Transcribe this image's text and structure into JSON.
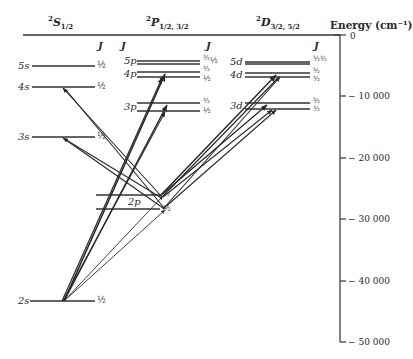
{
  "diagram": {
    "type": "grotrian-energy-level-diagram",
    "columns": [
      {
        "term": "S",
        "multiplicity": "2",
        "subscript": "1/2",
        "j_header": "J"
      },
      {
        "term": "P",
        "multiplicity": "2",
        "subscript": "1/2, 3/2",
        "j_header": "J"
      },
      {
        "term": "D",
        "multiplicity": "2",
        "subscript": "3/2, 5/2",
        "j_header": "J"
      }
    ],
    "axis": {
      "title": "Energy (cm⁻¹)",
      "ticks": [
        "0",
        "− 10 000",
        "− 20 000",
        "− 30 000",
        "− 40 000",
        "− 50 000"
      ],
      "tick_values": [
        0,
        -10000,
        -20000,
        -30000,
        -40000,
        -50000
      ]
    },
    "levels": {
      "s": [
        {
          "label": "5s",
          "j": "½",
          "energy": -5000
        },
        {
          "label": "4s",
          "j": "½",
          "energy": -8500
        },
        {
          "label": "3s",
          "j": "½",
          "energy": -16500
        },
        {
          "label": "2s",
          "j": "½",
          "energy": -43500
        }
      ],
      "p": [
        {
          "label": "5p",
          "j_values": [
            "³⁄₂",
            "½"
          ],
          "energies": [
            -4300,
            -4700
          ]
        },
        {
          "label": "4p",
          "j_values": [
            "³⁄₂",
            "½"
          ],
          "energies": [
            -6100,
            -6900
          ]
        },
        {
          "label": "3p",
          "j_values": [
            "³⁄₂",
            "½"
          ],
          "energies": [
            -11100,
            -12300
          ]
        },
        {
          "label": "2p",
          "j_values": [
            "³⁄₂",
            "½"
          ],
          "energies": [
            -26100,
            -28400
          ]
        }
      ],
      "d": [
        {
          "label": "5d",
          "j_values": [
            "⁵⁄₂",
            "³⁄₂"
          ],
          "energies": [
            -4400,
            -4700
          ]
        },
        {
          "label": "4d",
          "j_values": [
            "⁵⁄₂",
            "³⁄₂"
          ],
          "energies": [
            -6200,
            -6900
          ]
        },
        {
          "label": "3d",
          "j_values": [
            "⁵⁄₂",
            "³⁄₂"
          ],
          "energies": [
            -11100,
            -12100
          ]
        }
      ]
    },
    "transitions": [
      {
        "from": "2s",
        "to": "4p"
      },
      {
        "from": "2s",
        "to": "3p"
      },
      {
        "from": "2s",
        "to": "2p"
      },
      {
        "from": "2p",
        "to": "4s"
      },
      {
        "from": "2p",
        "to": "3s"
      },
      {
        "from": "2p",
        "to": "4d"
      },
      {
        "from": "2p",
        "to": "3d"
      }
    ]
  }
}
